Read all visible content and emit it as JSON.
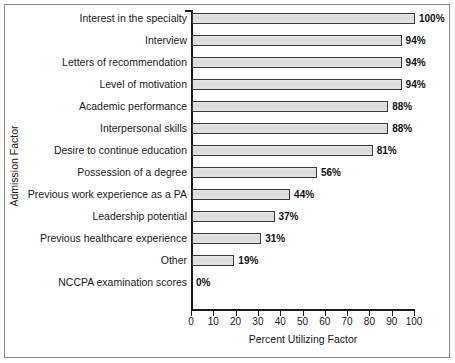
{
  "chart_data": {
    "type": "bar",
    "orientation": "horizontal",
    "title": "",
    "xlabel": "Percent Utilizing Factor",
    "ylabel": "Admission Factor",
    "xlim": [
      0,
      100
    ],
    "xticks": [
      "0",
      "10",
      "20",
      "30",
      "40",
      "50",
      "60",
      "70",
      "80",
      "90",
      "100"
    ],
    "grid": false,
    "legend": null,
    "bar_fill_color": "#dcdcdc",
    "bar_edge_color": "#3a3a3a",
    "axis_color": "#1a1a1a",
    "categories": [
      "Interest in the specialty",
      "Interview",
      "Letters of recommendation",
      "Level of motivation",
      "Academic performance",
      "Interpersonal skills",
      "Desire to continue education",
      "Possession of a degree",
      "Previous work experience as a PA",
      "Leadership potential",
      "Previous healthcare experience",
      "Other",
      "NCCPA examination scores"
    ],
    "values": [
      100,
      94,
      94,
      94,
      88,
      88,
      81,
      56,
      44,
      37,
      31,
      19,
      0
    ],
    "data_labels": [
      "100%",
      "94%",
      "94%",
      "94%",
      "88%",
      "88%",
      "81%",
      "56%",
      "44%",
      "37%",
      "31%",
      "19%",
      "0%"
    ]
  }
}
